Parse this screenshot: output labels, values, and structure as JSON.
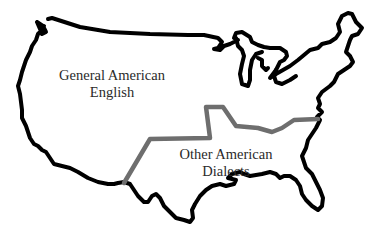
{
  "map": {
    "title": "American English dialect regions",
    "colors": {
      "outline": "#000000",
      "boundary": "#6e6e6e",
      "background": "#ffffff",
      "text": "#2a2a2a"
    },
    "regions": [
      {
        "id": "general",
        "line1": "General American",
        "line2": "English"
      },
      {
        "id": "other",
        "line1": "Other American",
        "line2": "Dialects"
      }
    ]
  }
}
